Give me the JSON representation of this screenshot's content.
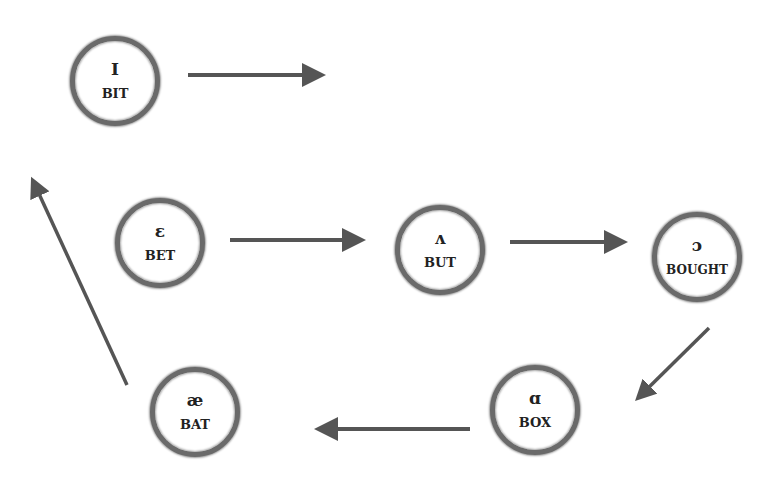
{
  "diagram": {
    "type": "vowel-chain",
    "nodes": [
      {
        "id": "bit",
        "symbol": "I",
        "word": "BIT",
        "cx": 115,
        "cy": 81
      },
      {
        "id": "bet",
        "symbol": "ɛ",
        "word": "BET",
        "cx": 160,
        "cy": 243
      },
      {
        "id": "but",
        "symbol": "ʌ",
        "word": "BUT",
        "cx": 440,
        "cy": 250
      },
      {
        "id": "bought",
        "symbol": "ɔ",
        "word": "BOUGHT",
        "cx": 697,
        "cy": 257
      },
      {
        "id": "bat",
        "symbol": "æ",
        "word": "BAT",
        "cx": 195,
        "cy": 412
      },
      {
        "id": "box",
        "symbol": "ɑ",
        "word": "BOX",
        "cx": 535,
        "cy": 410
      }
    ],
    "edges": [
      {
        "from": "bit",
        "to": "(offscreen right)"
      },
      {
        "from": "bet",
        "to": "but"
      },
      {
        "from": "but",
        "to": "bought"
      },
      {
        "from": "bought",
        "to": "box"
      },
      {
        "from": "box",
        "to": "bat"
      },
      {
        "from": "bat",
        "to": "(offscreen up-left)"
      }
    ],
    "colors": {
      "arrow": "#555555",
      "ring": "#6a6a6a",
      "text": "#222222"
    }
  }
}
